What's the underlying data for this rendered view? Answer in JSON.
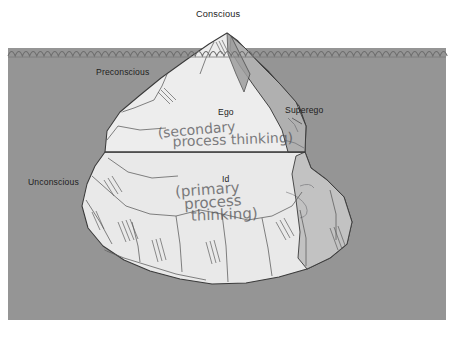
{
  "diagram": {
    "type": "iceberg-diagram"
  },
  "labels": {
    "conscious": "Conscious",
    "preconscious": "Preconscious",
    "unconscious": "Unconscious",
    "ego": "Ego",
    "superego": "Superego",
    "id": "Id"
  },
  "annotations": {
    "secondary_line1": "(secondary",
    "secondary_line2": "process thinking)",
    "primary_line1": "(primary",
    "primary_line2": "process",
    "primary_line3": "thinking)"
  },
  "colors": {
    "sky": "#ffffff",
    "water": "#9d9d9d",
    "ice_light": "#ededed",
    "ice_mid": "#d8d8d8",
    "ice_shadow": "#b3b3b3",
    "ice_dark": "#9b9b9b",
    "outline": "#3a3a3a",
    "text": "#1d1d1d",
    "pencil": "#4f4f52"
  }
}
